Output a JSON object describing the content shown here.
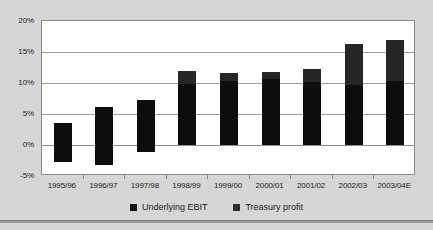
{
  "chart_data": {
    "type": "bar",
    "stacked": true,
    "title": "",
    "subtitle": "",
    "xlabel": "",
    "ylabel": "",
    "ylim": [
      -5,
      20
    ],
    "ytick_labels": [
      "20%",
      "15%",
      "10%",
      "5%",
      "0%",
      "-5%"
    ],
    "ytick_values": [
      20,
      15,
      10,
      5,
      0,
      -5
    ],
    "grid": true,
    "legend_position": "bottom",
    "categories": [
      "1995/96",
      "1996/97",
      "1997/98",
      "1998/99",
      "1999/00",
      "2000/01",
      "2001/02",
      "2002/03",
      "2003/04E"
    ],
    "series": [
      {
        "name": "Underlying EBIT",
        "color": "#0d0d0d",
        "values": [
          3.5,
          6.2,
          7.3,
          9.8,
          10.3,
          10.6,
          10.2,
          9.7,
          10.3
        ]
      },
      {
        "name": "Treasury profit",
        "color": "#2e2e2e",
        "values": [
          -2.7,
          -3.2,
          -1.2,
          2.2,
          1.3,
          1.1,
          2.1,
          6.6,
          6.6
        ]
      }
    ],
    "bar_tops": [
      3.5,
      6.2,
      7.3,
      12.0,
      11.6,
      11.7,
      12.3,
      16.3,
      16.9
    ],
    "bar_bottoms": [
      -2.7,
      -3.2,
      -1.2,
      0.0,
      0.0,
      0.0,
      0.0,
      0.0,
      0.0
    ],
    "segment_splits": [
      null,
      null,
      null,
      9.8,
      10.3,
      10.6,
      10.2,
      9.7,
      10.3
    ]
  },
  "legend": {
    "items": [
      {
        "label": "Underlying EBIT",
        "swatch": "ebit"
      },
      {
        "label": "Treasury profit",
        "swatch": "treasury"
      }
    ]
  },
  "colors": {
    "background": "#d6d6d6",
    "plot_background": "#ffffff",
    "gridline": "#9b9b9b",
    "frame": "#8a8a8a",
    "ebit": "#0d0d0d",
    "treasury": "#2e2e2e",
    "text": "#1a1a1a"
  }
}
